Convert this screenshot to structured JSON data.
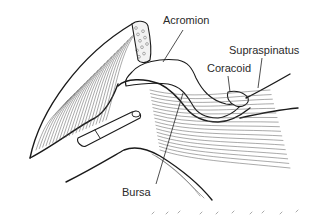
{
  "figure": {
    "labels": [
      {
        "id": "acromion",
        "text": "Acromion"
      },
      {
        "id": "supraspinatus",
        "text": "Supraspinatus"
      },
      {
        "id": "coracoid",
        "text": "Coracoid"
      },
      {
        "id": "bursa",
        "text": "Bursa"
      }
    ]
  }
}
